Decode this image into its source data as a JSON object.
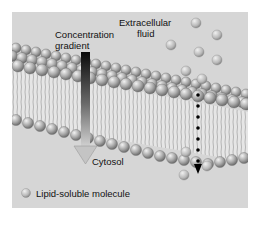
{
  "diagram": {
    "labels": {
      "extracellular_line1": "Extracellular",
      "extracellular_line2": "fluid",
      "gradient_line1": "Concentration",
      "gradient_line2": "gradient",
      "cytosol": "Cytosol",
      "legend": "Lipid-soluble molecule"
    },
    "colors": {
      "background": "#d6d6d6",
      "molecule": "#b4b4b4",
      "head": "#9a9a9a",
      "tail": "#efefef",
      "gradient_top": "#111111",
      "gradient_bottom": "#cfcfcf"
    }
  }
}
